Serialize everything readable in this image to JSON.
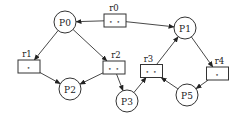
{
  "diagram": {
    "type": "petri-net",
    "places": [
      {
        "id": "P0",
        "label": "P0"
      },
      {
        "id": "P1",
        "label": "P1"
      },
      {
        "id": "P2",
        "label": "P2"
      },
      {
        "id": "P3",
        "label": "P3"
      },
      {
        "id": "P5",
        "label": "P5"
      }
    ],
    "transitions": [
      {
        "id": "r0",
        "label": "r0",
        "tokens": "• •"
      },
      {
        "id": "r1",
        "label": "r1",
        "tokens": "•"
      },
      {
        "id": "r2",
        "label": "r2",
        "tokens": "• •"
      },
      {
        "id": "r3",
        "label": "r3",
        "tokens": "• •"
      },
      {
        "id": "r4",
        "label": "r4",
        "tokens": "•"
      }
    ],
    "edges": [
      {
        "from": "r0",
        "to": "P0"
      },
      {
        "from": "r0",
        "to": "P1"
      },
      {
        "from": "P0",
        "to": "r1"
      },
      {
        "from": "P0",
        "to": "r2"
      },
      {
        "from": "r1",
        "to": "P2"
      },
      {
        "from": "r2",
        "to": "P2"
      },
      {
        "from": "r2",
        "to": "P3"
      },
      {
        "from": "P3",
        "to": "r3"
      },
      {
        "from": "P5",
        "to": "r3"
      },
      {
        "from": "r3",
        "to": "P1"
      },
      {
        "from": "P1",
        "to": "r4"
      },
      {
        "from": "r4",
        "to": "P5"
      }
    ]
  }
}
